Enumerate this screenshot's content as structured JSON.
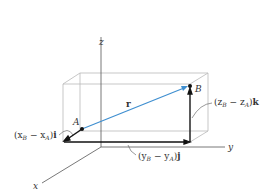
{
  "diagram": {
    "axes": {
      "x": "x",
      "y": "y",
      "z": "z"
    },
    "points": {
      "A": "A",
      "B": "B"
    },
    "vector": {
      "name": "r",
      "color": "#3f8fd0"
    },
    "components": {
      "i": {
        "pre": "(x",
        "sub1": "B",
        "mid": " − x",
        "sub2": "A",
        "post": ")",
        "unit": "i"
      },
      "j": {
        "pre": "(y",
        "sub1": "B",
        "mid": " − y",
        "sub2": "A",
        "post": ")",
        "unit": "j"
      },
      "k": {
        "pre": "(z",
        "sub1": "B",
        "mid": " − z",
        "sub2": "A",
        "post": ")",
        "unit": "k"
      }
    }
  }
}
